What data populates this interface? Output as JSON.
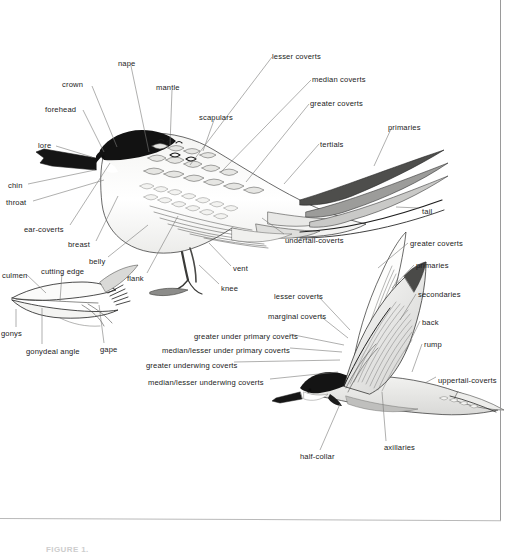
{
  "figure": {
    "caption": "FIGURE 1.",
    "border_color": "#9a9a9a",
    "ink_color": "#1b1b22",
    "paper_color": "#ffffff"
  },
  "perched_bird": {
    "name": "perched-tern-standing",
    "labels": [
      {
        "id": "crown",
        "text": "crown",
        "x": 62,
        "y": 81,
        "align": "left",
        "lx": 92,
        "ly": 86,
        "tx": 117,
        "ty": 147
      },
      {
        "id": "nape",
        "text": "nape",
        "x": 118,
        "y": 60,
        "align": "left",
        "lx": 131,
        "ly": 66,
        "tx": 149,
        "ty": 152
      },
      {
        "id": "forehead",
        "text": "forehead",
        "x": 45,
        "y": 106,
        "align": "left",
        "lx": 83,
        "ly": 110,
        "tx": 104,
        "ty": 152
      },
      {
        "id": "mantle",
        "text": "mantle",
        "x": 156,
        "y": 84,
        "align": "left",
        "lx": 172,
        "ly": 90,
        "tx": 170,
        "ty": 145
      },
      {
        "id": "scapulars",
        "text": "scapulars",
        "x": 199,
        "y": 114,
        "align": "left",
        "lx": 214,
        "ly": 120,
        "tx": 203,
        "ty": 151
      },
      {
        "id": "lore",
        "text": "lore",
        "x": 38,
        "y": 142,
        "align": "left",
        "lx": 56,
        "ly": 146,
        "tx": 92,
        "ty": 157
      },
      {
        "id": "chin",
        "text": "chin",
        "x": 8,
        "y": 182,
        "align": "left",
        "lx": 28,
        "ly": 184,
        "tx": 95,
        "ty": 170
      },
      {
        "id": "throat",
        "text": "throat",
        "x": 6,
        "y": 199,
        "align": "left",
        "lx": 33,
        "ly": 201,
        "tx": 104,
        "ty": 180
      },
      {
        "id": "ear-coverts",
        "text": "ear-coverts",
        "x": 24,
        "y": 226,
        "align": "left",
        "lx": 70,
        "ly": 225,
        "tx": 110,
        "ty": 163
      },
      {
        "id": "breast",
        "text": "breast",
        "x": 68,
        "y": 241,
        "align": "left",
        "lx": 96,
        "ly": 241,
        "tx": 118,
        "ty": 196
      },
      {
        "id": "belly",
        "text": "belly",
        "x": 89,
        "y": 258,
        "align": "left",
        "lx": 108,
        "ly": 257,
        "tx": 148,
        "ty": 225
      },
      {
        "id": "flank",
        "text": "flank",
        "x": 127,
        "y": 275,
        "align": "left",
        "lx": 147,
        "ly": 273,
        "tx": 178,
        "ty": 216
      },
      {
        "id": "vent",
        "text": "vent",
        "x": 233,
        "y": 265,
        "align": "left",
        "lx": 231,
        "ly": 266,
        "tx": 209,
        "ty": 243
      },
      {
        "id": "knee",
        "text": "knee",
        "x": 221,
        "y": 285,
        "align": "left",
        "lx": 219,
        "ly": 284,
        "tx": 199,
        "ty": 265
      },
      {
        "id": "lesser-coverts",
        "text": "lesser coverts",
        "x": 272,
        "y": 53,
        "align": "left",
        "lx": 272,
        "ly": 57,
        "tx": 190,
        "ty": 165
      },
      {
        "id": "median-coverts",
        "text": "median coverts",
        "x": 312,
        "y": 76,
        "align": "left",
        "lx": 311,
        "ly": 80,
        "tx": 221,
        "ty": 172
      },
      {
        "id": "greater-coverts",
        "text": "greater coverts",
        "x": 310,
        "y": 100,
        "align": "left",
        "lx": 309,
        "ly": 104,
        "tx": 246,
        "ty": 182
      },
      {
        "id": "tertials",
        "text": "tertials",
        "x": 320,
        "y": 141,
        "align": "left",
        "lx": 319,
        "ly": 144,
        "tx": 284,
        "ty": 184
      },
      {
        "id": "primaries",
        "text": "primaries",
        "x": 388,
        "y": 124,
        "align": "left",
        "lx": 391,
        "ly": 129,
        "tx": 374,
        "ty": 166
      },
      {
        "id": "tail",
        "text": "tail",
        "x": 422,
        "y": 208,
        "align": "left",
        "lx": 419,
        "ly": 208,
        "tx": 396,
        "ty": 207
      },
      {
        "id": "undertail-coverts",
        "text": "undertail-coverts",
        "x": 285,
        "y": 237,
        "align": "left",
        "lx": 284,
        "ly": 234,
        "tx": 262,
        "ty": 218
      }
    ]
  },
  "bill_detail": {
    "name": "bill-detail-diagram",
    "labels": [
      {
        "id": "culmen",
        "text": "culmen",
        "x": 2,
        "y": 272,
        "align": "left",
        "lx": 26,
        "ly": 274,
        "tx": 46,
        "ty": 293
      },
      {
        "id": "cutting-edge",
        "text": "cutting edge",
        "x": 41,
        "y": 268,
        "align": "left",
        "lx": 62,
        "ly": 273,
        "tx": 60,
        "ty": 301
      },
      {
        "id": "gonys",
        "text": "gonys",
        "x": 1,
        "y": 330,
        "align": "left",
        "lx": 16,
        "ly": 327,
        "tx": 16,
        "ty": 309
      },
      {
        "id": "gonydeal-angle",
        "text": "gonydeal angle",
        "x": 26,
        "y": 348,
        "align": "left",
        "lx": 42,
        "ly": 344,
        "tx": 42,
        "ty": 308
      },
      {
        "id": "gape",
        "text": "gape",
        "x": 100,
        "y": 346,
        "align": "left",
        "lx": 104,
        "ly": 343,
        "tx": 99,
        "ty": 305
      }
    ]
  },
  "flying_bird": {
    "name": "flying-tern-underwing",
    "labels": [
      {
        "id": "greater-coverts-fly",
        "text": "greater coverts",
        "x": 410,
        "y": 240,
        "align": "left",
        "lx": 408,
        "ly": 243,
        "tx": 378,
        "ty": 268
      },
      {
        "id": "primaries-fly",
        "text": "primaries",
        "x": 416,
        "y": 262,
        "align": "left",
        "lx": 414,
        "ly": 265,
        "tx": 392,
        "ty": 288
      },
      {
        "id": "secondaries",
        "text": "secondaries",
        "x": 418,
        "y": 291,
        "align": "left",
        "lx": 416,
        "ly": 294,
        "tx": 400,
        "ty": 320
      },
      {
        "id": "back",
        "text": "back",
        "x": 422,
        "y": 319,
        "align": "left",
        "lx": 420,
        "ly": 321,
        "tx": 405,
        "ty": 352
      },
      {
        "id": "rump",
        "text": "rump",
        "x": 424,
        "y": 341,
        "align": "left",
        "lx": 422,
        "ly": 344,
        "tx": 412,
        "ty": 372
      },
      {
        "id": "uppertail-coverts",
        "text": "uppertail-coverts",
        "x": 438,
        "y": 377,
        "align": "left",
        "lx": 436,
        "ly": 377,
        "tx": 425,
        "ty": 383
      },
      {
        "id": "lesser-coverts-fly",
        "text": "lesser coverts",
        "x": 274,
        "y": 293,
        "align": "left",
        "lx": 318,
        "ly": 296,
        "tx": 350,
        "ty": 330
      },
      {
        "id": "marginal-coverts",
        "text": "marginal coverts",
        "x": 268,
        "y": 313,
        "align": "left",
        "lx": 319,
        "ly": 315,
        "tx": 348,
        "ty": 338
      },
      {
        "id": "greater-under-primary",
        "text": "greater under primary coverts",
        "x": 194,
        "y": 333,
        "align": "left",
        "lx": 289,
        "ly": 334,
        "tx": 344,
        "ty": 345
      },
      {
        "id": "median-lesser-under-primary",
        "text": "median/lesser under primary coverts",
        "x": 162,
        "y": 347,
        "align": "left",
        "lx": 290,
        "ly": 348,
        "tx": 342,
        "ty": 352
      },
      {
        "id": "greater-underwing-coverts",
        "text": "greater underwing coverts",
        "x": 146,
        "y": 362,
        "align": "left",
        "lx": 234,
        "ly": 362,
        "tx": 340,
        "ty": 360
      },
      {
        "id": "median-lesser-underwing",
        "text": "median/lesser underwing coverts",
        "x": 148,
        "y": 379,
        "align": "left",
        "lx": 270,
        "ly": 379,
        "tx": 338,
        "ty": 372
      },
      {
        "id": "half-collar",
        "text": "half-collar",
        "x": 300,
        "y": 453,
        "align": "left",
        "lx": 320,
        "ly": 450,
        "tx": 340,
        "ty": 404
      },
      {
        "id": "axillaries",
        "text": "axillaries",
        "x": 384,
        "y": 444,
        "align": "left",
        "lx": 386,
        "ly": 441,
        "tx": 382,
        "ty": 392
      }
    ]
  }
}
